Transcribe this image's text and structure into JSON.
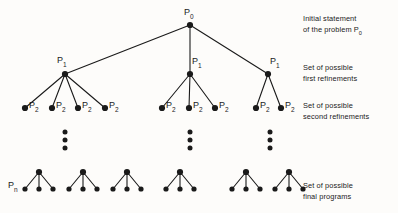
{
  "figure": {
    "background_color": "#fdfcfa",
    "ink_color": "#1a1a1a",
    "width": 398,
    "height": 213
  },
  "node_labels": {
    "root": {
      "base": "P",
      "sub": "0",
      "x": 184,
      "y": 8
    },
    "level1": [
      {
        "base": "P",
        "sub": "1",
        "x": 57,
        "y": 56
      },
      {
        "base": "P",
        "sub": "1",
        "x": 192,
        "y": 57
      },
      {
        "base": "P",
        "sub": "1",
        "x": 270,
        "y": 57
      }
    ],
    "level2": [
      {
        "base": "P",
        "sub": "2",
        "x": 29,
        "y": 101
      },
      {
        "base": "P",
        "sub": "2",
        "x": 56,
        "y": 101
      },
      {
        "base": "P",
        "sub": "2",
        "x": 82,
        "y": 101
      },
      {
        "base": "P",
        "sub": "2",
        "x": 109,
        "y": 101
      },
      {
        "base": "P",
        "sub": "2",
        "x": 166,
        "y": 101
      },
      {
        "base": "P",
        "sub": "2",
        "x": 193,
        "y": 101
      },
      {
        "base": "P",
        "sub": "2",
        "x": 219,
        "y": 101
      },
      {
        "base": "P",
        "sub": "2",
        "x": 260,
        "y": 101
      },
      {
        "base": "P",
        "sub": "2",
        "x": 285,
        "y": 101
      }
    ],
    "leaf": {
      "base": "P",
      "sub": "n",
      "x": 8,
      "y": 181
    }
  },
  "side_labels": [
    {
      "name": "initial-statement",
      "line1": "Initial statement",
      "line2_pre": "of the problem P",
      "line2_sub": "0",
      "x": 303,
      "y": 14
    },
    {
      "name": "first-refinements",
      "line1": "Set of possible",
      "line2_pre": "first refinements",
      "line2_sub": "",
      "x": 303,
      "y": 63
    },
    {
      "name": "second-refinements",
      "line1": "Set of possible",
      "line2_pre": "second refinements",
      "line2_sub": "",
      "x": 303,
      "y": 101
    },
    {
      "name": "final-programs",
      "line1": "Set of possible",
      "line2_pre": "final programs",
      "line2_sub": "",
      "x": 303,
      "y": 181
    }
  ],
  "chart_data": {
    "type": "diagram",
    "diagram_kind": "stepwise-refinement-tree",
    "levels": [
      {
        "level": 0,
        "label": "P0",
        "y": 25,
        "node_count": 1
      },
      {
        "level": 1,
        "label": "P1",
        "y": 74,
        "node_count": 3
      },
      {
        "level": 2,
        "label": "P2",
        "y": 108,
        "node_count": 9
      },
      {
        "level": 3,
        "label": "ellipsis",
        "y": 140,
        "node_count": 3
      },
      {
        "level": 4,
        "label": "Pn",
        "y": 176,
        "node_count": 6
      }
    ],
    "nodes": {
      "root": {
        "x": 190,
        "y": 25
      },
      "level1": [
        {
          "x": 65,
          "y": 74
        },
        {
          "x": 190,
          "y": 74
        },
        {
          "x": 268,
          "y": 74
        }
      ],
      "level2": [
        {
          "x": 25,
          "y": 108,
          "parent": 0
        },
        {
          "x": 52,
          "y": 108,
          "parent": 0
        },
        {
          "x": 78,
          "y": 108,
          "parent": 0
        },
        {
          "x": 105,
          "y": 108,
          "parent": 0
        },
        {
          "x": 162,
          "y": 108,
          "parent": 1
        },
        {
          "x": 189,
          "y": 108,
          "parent": 1
        },
        {
          "x": 215,
          "y": 108,
          "parent": 1
        },
        {
          "x": 256,
          "y": 108,
          "parent": 2
        },
        {
          "x": 281,
          "y": 108,
          "parent": 2
        }
      ],
      "ellipses": [
        {
          "x": 65,
          "dots_y": [
            132,
            140,
            148
          ]
        },
        {
          "x": 190,
          "dots_y": [
            132,
            140,
            148
          ]
        },
        {
          "x": 270,
          "dots_y": [
            132,
            140,
            148
          ]
        }
      ],
      "tridents": [
        {
          "apex_x": 39,
          "apex_y": 172,
          "children_x": [
            25,
            39,
            53
          ],
          "children_y": [
            189,
            189,
            189
          ]
        },
        {
          "apex_x": 83,
          "apex_y": 172,
          "children_x": [
            69,
            83,
            97
          ],
          "children_y": [
            189,
            189,
            189
          ]
        },
        {
          "apex_x": 127,
          "apex_y": 172,
          "children_x": [
            113,
            127,
            141
          ],
          "children_y": [
            189,
            189,
            189
          ]
        },
        {
          "apex_x": 180,
          "apex_y": 172,
          "children_x": [
            166,
            180,
            194
          ],
          "children_y": [
            189,
            189,
            189
          ]
        },
        {
          "apex_x": 246,
          "apex_y": 172,
          "children_x": [
            232,
            246,
            260
          ],
          "children_y": [
            189,
            189,
            189
          ]
        },
        {
          "apex_x": 289,
          "apex_y": 172,
          "children_x": [
            275,
            289,
            303
          ],
          "children_y": [
            189,
            189,
            189
          ]
        }
      ]
    },
    "edges": [
      {
        "from": "root",
        "to": "level1.0"
      },
      {
        "from": "root",
        "to": "level1.1"
      },
      {
        "from": "root",
        "to": "level1.2"
      },
      {
        "from": "level1.0",
        "to": "level2.0"
      },
      {
        "from": "level1.0",
        "to": "level2.1"
      },
      {
        "from": "level1.0",
        "to": "level2.2"
      },
      {
        "from": "level1.0",
        "to": "level2.3"
      },
      {
        "from": "level1.1",
        "to": "level2.4"
      },
      {
        "from": "level1.1",
        "to": "level2.5"
      },
      {
        "from": "level1.1",
        "to": "level2.6"
      },
      {
        "from": "level1.2",
        "to": "level2.7"
      },
      {
        "from": "level1.2",
        "to": "level2.8"
      }
    ],
    "node_radius": 3.1,
    "leaf_radius": 2.6,
    "dot_radius": 2.5,
    "edge_width": 1.1
  }
}
